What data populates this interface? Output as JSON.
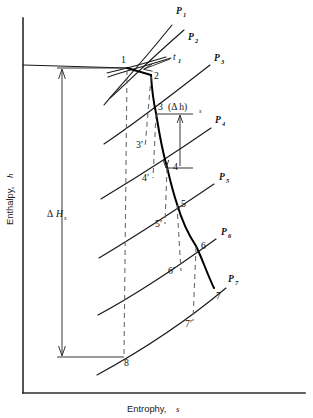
{
  "figure": {
    "name": "mollier-enthalpy-entropy-diagram",
    "kind": "thermodynamic-expansion-diagram",
    "axes": {
      "y_title": "Enthalpy,",
      "y_symbol": "h",
      "x_title": "Entrophy,",
      "x_symbol": "s"
    },
    "dimension_labels": {
      "total_drop_delta": "Δ",
      "total_drop_main": "H",
      "total_drop_sub": "s",
      "stage_drop_text": "(Δ h)",
      "stage_drop_sub": "s"
    },
    "temperature_label": {
      "main": "t",
      "sub": "1"
    },
    "pressure_lines": [
      {
        "label": "P",
        "sub": "1",
        "label_x": 176,
        "label_y": 14
      },
      {
        "label": "P",
        "sub": "2",
        "label_x": 188,
        "label_y": 40
      },
      {
        "label": "P",
        "sub": "3",
        "label_x": 214,
        "label_y": 61
      },
      {
        "label": "P",
        "sub": "4",
        "label_x": 215,
        "label_y": 123
      },
      {
        "label": "P",
        "sub": "5",
        "label_x": 219,
        "label_y": 180
      },
      {
        "label": "P",
        "sub": "6",
        "label_x": 221,
        "label_y": 235
      },
      {
        "label": "P",
        "sub": "7",
        "label_x": 228,
        "label_y": 282
      }
    ],
    "state_points": [
      {
        "id": "1",
        "label": "1",
        "x": 127,
        "y": 68,
        "label_x": 121,
        "label_y": 63
      },
      {
        "id": "2",
        "label": "2",
        "x": 151,
        "y": 75,
        "label_x": 154,
        "label_y": 79
      },
      {
        "id": "3",
        "label": "3",
        "x": 155,
        "y": 112,
        "label_x": 158,
        "label_y": 110
      },
      {
        "id": "3p",
        "label": "3′",
        "x": 143,
        "y": 145,
        "label_x": 137,
        "label_y": 148
      },
      {
        "id": "4",
        "label": "4",
        "x": 166,
        "y": 166,
        "label_x": 173,
        "label_y": 170
      },
      {
        "id": "4p",
        "label": "4′",
        "x": 152,
        "y": 176,
        "label_x": 143,
        "label_y": 180
      },
      {
        "id": "5",
        "label": "5",
        "x": 176,
        "y": 203,
        "label_x": 181,
        "label_y": 207
      },
      {
        "id": "5p",
        "label": "5′",
        "x": 164,
        "y": 223,
        "label_x": 156,
        "label_y": 227
      },
      {
        "id": "6",
        "label": "6",
        "x": 195,
        "y": 245,
        "label_x": 201,
        "label_y": 249
      },
      {
        "id": "6p",
        "label": "6′",
        "x": 180,
        "y": 270,
        "label_x": 169,
        "label_y": 274
      },
      {
        "id": "7",
        "label": "7",
        "x": 213,
        "y": 287,
        "label_x": 216,
        "label_y": 299
      },
      {
        "id": "7p",
        "label": "7′",
        "x": 192,
        "y": 320,
        "label_x": 186,
        "label_y": 326
      },
      {
        "id": "8",
        "label": "8",
        "x": 122,
        "y": 357,
        "label_x": 124,
        "label_y": 366
      }
    ],
    "colors": {
      "ink": "#111111",
      "axis": "#2b2b2b",
      "dashed": "#6b6b6b",
      "background": "#ffffff",
      "expansion": "#000000"
    }
  }
}
